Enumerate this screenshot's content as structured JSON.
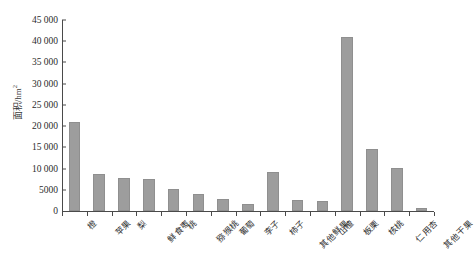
{
  "chart_data": {
    "type": "bar",
    "title": "",
    "xlabel": "",
    "ylabel": "面积/hm²",
    "ylabel_text": "面积/hm",
    "ylabel_sup": "2",
    "ylim": [
      0,
      45000
    ],
    "grid": false,
    "legend": "none",
    "bar_color": "#9d9d9d",
    "axis_color": "#4a4a4a",
    "yticks": [
      {
        "value": 45000,
        "label": "45 000"
      },
      {
        "value": 40000,
        "label": "40 000"
      },
      {
        "value": 35000,
        "label": "35 000"
      },
      {
        "value": 30000,
        "label": "30 000"
      },
      {
        "value": 25000,
        "label": "25 000"
      },
      {
        "value": 20000,
        "label": "20 000"
      },
      {
        "value": 15000,
        "label": "15 000"
      },
      {
        "value": 10000,
        "label": "10 000"
      },
      {
        "value": 5000,
        "label": "5000"
      },
      {
        "value": 0,
        "label": "0"
      }
    ],
    "categories": [
      "橙",
      "苹果",
      "梨",
      "鲜食枣",
      "桃",
      "猕猴桃",
      "葡萄",
      "李子",
      "柿子",
      "其他鲜果",
      "山楂",
      "板栗",
      "核桃",
      "仁用杏",
      "其他干果"
    ],
    "data": [
      {
        "category": "橙",
        "value": 21000
      },
      {
        "category": "苹果",
        "value": 8700
      },
      {
        "category": "梨",
        "value": 7800
      },
      {
        "category": "鲜食枣",
        "value": 7500
      },
      {
        "category": "桃",
        "value": 5100
      },
      {
        "category": "猕猴桃",
        "value": 3900
      },
      {
        "category": "葡萄",
        "value": 2800
      },
      {
        "category": "李子",
        "value": 1700
      },
      {
        "category": "柿子",
        "value": 9200
      },
      {
        "category": "其他鲜果",
        "value": 2600
      },
      {
        "category": "山楂",
        "value": 2400
      },
      {
        "category": "板栗",
        "value": 41000
      },
      {
        "category": "核桃",
        "value": 14500
      },
      {
        "category": "仁用杏",
        "value": 10200
      },
      {
        "category": "其他干果",
        "value": 700
      }
    ],
    "values": [
      21000,
      8700,
      7800,
      7500,
      5100,
      3900,
      2800,
      1700,
      9200,
      2600,
      2400,
      41000,
      14500,
      10200,
      700
    ]
  }
}
